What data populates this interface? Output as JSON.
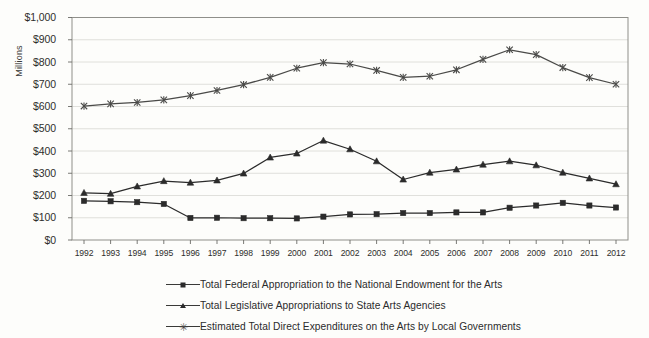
{
  "chart_data": {
    "type": "line",
    "title": "",
    "xlabel": "",
    "ylabel": "Millions",
    "ylim": [
      0,
      1000
    ],
    "ytick_step": 100,
    "grid": true,
    "legend_position": "bottom",
    "x": [
      1992,
      1993,
      1994,
      1995,
      1996,
      1997,
      1998,
      1999,
      2000,
      2001,
      2002,
      2003,
      2004,
      2005,
      2006,
      2007,
      2008,
      2009,
      2010,
      2011,
      2012
    ],
    "categories": [
      "1992",
      "1993",
      "1994",
      "1995",
      "1996",
      "1997",
      "1998",
      "1999",
      "2000",
      "2001",
      "2002",
      "2003",
      "2004",
      "2005",
      "2006",
      "2007",
      "2008",
      "2009",
      "2010",
      "2011",
      "2012"
    ],
    "ytick_labels": [
      "$1,000",
      "$900",
      "$800",
      "$700",
      "$600",
      "$500",
      "$400",
      "$300",
      "$200",
      "$100",
      "$0"
    ],
    "ytick_values": [
      1000,
      900,
      800,
      700,
      600,
      500,
      400,
      300,
      200,
      100,
      0
    ],
    "series": [
      {
        "name": "Total Federal Appropriation to the National Endowment for the Arts",
        "marker": "square",
        "color": "#2b2b2b",
        "values": [
          176,
          174,
          170,
          162,
          99,
          100,
          98,
          98,
          97,
          105,
          115,
          116,
          121,
          121,
          124,
          124,
          145,
          155,
          167,
          155,
          146
        ]
      },
      {
        "name": "Total Legislative Appropriations to State Arts Agencies",
        "marker": "triangle",
        "color": "#2b2b2b",
        "values": [
          212,
          208,
          241,
          265,
          258,
          268,
          299,
          371,
          389,
          447,
          408,
          354,
          272,
          303,
          317,
          339,
          354,
          336,
          303,
          277,
          251
        ]
      },
      {
        "name": "Estimated Total Direct Expenditures on the Arts by Local Governments",
        "marker": "x",
        "color": "#4a4a48",
        "values": [
          602,
          612,
          618,
          630,
          649,
          672,
          698,
          731,
          772,
          797,
          791,
          762,
          731,
          736,
          765,
          812,
          855,
          833,
          775,
          730,
          700
        ]
      }
    ]
  },
  "legend": {
    "items": [
      {
        "label": "Total Federal Appropriation to the National Endowment for the Arts",
        "marker": "square"
      },
      {
        "label": "Total Legislative Appropriations to State Arts Agencies",
        "marker": "triangle"
      },
      {
        "label": "Estimated Total Direct Expenditures on the Arts by Local Governments",
        "marker": "x"
      }
    ]
  }
}
